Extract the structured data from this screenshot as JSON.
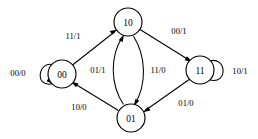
{
  "diagram": {
    "type": "state-transition-diagram",
    "colors": {
      "background": "#ffffff",
      "stroke": "#000000",
      "node_fill": "#ffffff",
      "text": "#000000"
    },
    "states": [
      {
        "id": "s10",
        "label": "10",
        "cx": 128,
        "cy": 22,
        "r": 14
      },
      {
        "id": "s00",
        "label": "00",
        "cx": 62,
        "cy": 74,
        "r": 14
      },
      {
        "id": "s11",
        "label": "11",
        "cx": 200,
        "cy": 70,
        "r": 14
      },
      {
        "id": "s01",
        "label": "01",
        "cx": 131,
        "cy": 118,
        "r": 14
      }
    ],
    "transitions": [
      {
        "id": "t-00-00",
        "from": "s00",
        "to": "s00",
        "label": "00/0",
        "kind": "self-loop",
        "label_x": 18,
        "label_y": 73
      },
      {
        "id": "t-00-10",
        "from": "s00",
        "to": "s10",
        "label": "11/1",
        "kind": "straight",
        "label_x": 73,
        "label_y": 36
      },
      {
        "id": "t-10-11",
        "from": "s10",
        "to": "s11",
        "label": "00/1",
        "kind": "straight",
        "label_x": 179,
        "label_y": 31
      },
      {
        "id": "t-11-11",
        "from": "s11",
        "to": "s11",
        "label": "10/1",
        "kind": "self-loop",
        "label_x": 240,
        "label_y": 71
      },
      {
        "id": "t-11-01",
        "from": "s11",
        "to": "s01",
        "label": "01/0",
        "kind": "straight",
        "label_x": 186,
        "label_y": 103
      },
      {
        "id": "t-01-00",
        "from": "s01",
        "to": "s00",
        "label": "10/0",
        "kind": "straight",
        "label_x": 79,
        "label_y": 107
      },
      {
        "id": "t-01-10",
        "from": "s01",
        "to": "s10",
        "label": "01/1",
        "kind": "curve-left",
        "label_x": 98,
        "label_y": 70
      },
      {
        "id": "t-10-01",
        "from": "s10",
        "to": "s01",
        "label": "11/0",
        "kind": "curve-right",
        "label_x": 158,
        "label_y": 70
      }
    ]
  }
}
